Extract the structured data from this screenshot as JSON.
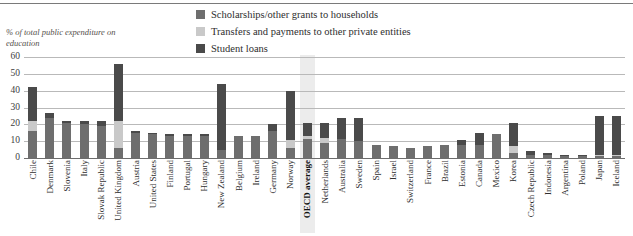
{
  "axis_caption": "% of total public expenditure on education",
  "legend": {
    "items": [
      {
        "label": "Scholarships/other grants to households",
        "color": "#6e6e6e",
        "key": "scholarships"
      },
      {
        "label": "Transfers and payments to other private entities",
        "color": "#c9c9c9",
        "key": "transfers"
      },
      {
        "label": "Student loans",
        "color": "#4a4a4a",
        "key": "loans"
      }
    ]
  },
  "highlight_category": "OECD average",
  "chart_data": {
    "type": "bar",
    "subtype": "stacked-column",
    "title": "",
    "xlabel": "",
    "ylabel": "% of total public expenditure on education",
    "ylim": [
      0,
      60
    ],
    "yticks": [
      0,
      10,
      20,
      30,
      40,
      50,
      60
    ],
    "grid": true,
    "legend_position": "top-center",
    "categories": [
      "Chile",
      "Denmark",
      "Slovenia",
      "Italy",
      "Slovak Republic",
      "United Kingdom",
      "Austria",
      "United States",
      "Finland",
      "Portugal",
      "Hungary",
      "New Zealand",
      "Belgium",
      "Ireland",
      "Germany",
      "Norway",
      "OECD average",
      "Netherlands",
      "Australia",
      "Sweden",
      "Spain",
      "Israel",
      "Switzerland",
      "France",
      "Brazil",
      "Estonia",
      "Canada",
      "Mexico",
      "Korea",
      "Czech Republic",
      "Indonesia",
      "Argentina",
      "Poland",
      "Japan",
      "Iceland"
    ],
    "series": [
      {
        "name": "Scholarships/other grants to households",
        "color": "#6e6e6e",
        "values": [
          16,
          24,
          21,
          20,
          19,
          6,
          15,
          14,
          13,
          13,
          13,
          5,
          13,
          13,
          16,
          6,
          11,
          9,
          11,
          10,
          8,
          7,
          6,
          7,
          8,
          8,
          8,
          14,
          3,
          2,
          2,
          1,
          1,
          1,
          1
        ]
      },
      {
        "name": "Transfers and payments to other private entities",
        "color": "#c9c9c9",
        "values": [
          6,
          0,
          0,
          0,
          0,
          16,
          0,
          0,
          0,
          0,
          0,
          0,
          0,
          0,
          0,
          5,
          2,
          3,
          0,
          0,
          0,
          0,
          0,
          0,
          0,
          0,
          0,
          0,
          4,
          0,
          0,
          0,
          0,
          1,
          1
        ]
      },
      {
        "name": "Student loans",
        "color": "#4a4a4a",
        "values": [
          20,
          3,
          1,
          2,
          3,
          34,
          1,
          1,
          1,
          1,
          1,
          39,
          0,
          0,
          4,
          29,
          8,
          9,
          13,
          14,
          0,
          0,
          0,
          0,
          0,
          3,
          7,
          0,
          14,
          2,
          1,
          1,
          1,
          23,
          23
        ]
      }
    ],
    "totals": [
      42,
      27,
      22,
      22,
      22,
      56,
      16,
      15,
      14,
      14,
      14,
      44,
      13,
      13,
      20,
      40,
      21,
      21,
      24,
      24,
      8,
      7,
      6,
      7,
      8,
      11,
      15,
      14,
      21,
      4,
      3,
      2,
      2,
      25,
      25
    ]
  }
}
